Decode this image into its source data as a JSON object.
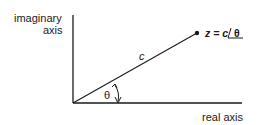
{
  "diagram": {
    "y_axis_label_line1": "imaginary",
    "y_axis_label_line2": "axis",
    "x_axis_label": "real axis",
    "vector_label": "c",
    "angle_label": "θ",
    "point_label_prefix": "z = c ",
    "point_label_angle": "θ",
    "colors": {
      "ink": "#1a1a1a",
      "background": "#ffffff"
    }
  }
}
